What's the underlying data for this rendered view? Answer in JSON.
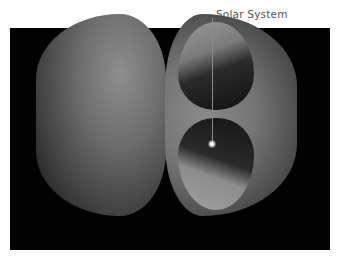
{
  "figure": {
    "label": "Solar System",
    "colors": {
      "background": "#ffffff",
      "panel": "#020202",
      "label_text": "#555555",
      "leader_line": "#8a8a8a"
    },
    "elements": [
      {
        "name": "left-hemisphere",
        "description": "Outer shell half, gray shaded"
      },
      {
        "name": "right-hemisphere",
        "description": "Cut-away half showing interior cavity"
      },
      {
        "name": "sun-point",
        "description": "Bright point at center marking the Solar System"
      }
    ]
  }
}
